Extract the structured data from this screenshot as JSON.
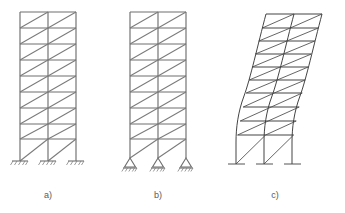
{
  "figure": {
    "background_color": "#ffffff",
    "line_color": "#6e6e6e",
    "deformed_line_color": "#3a3a3a",
    "caption_color": "#5a5a5a"
  },
  "panels": [
    {
      "id": "a",
      "label": "a)",
      "description": "Braced frame with fixed bases",
      "support_type": "fixed",
      "bays": 2,
      "stories": 9,
      "brace_direction": "bottom-left-to-top-right",
      "columns_x": [
        20,
        48,
        76
      ],
      "base_y": 161,
      "top_y": 12,
      "ground_story_height": 22,
      "typical_story_height": 16,
      "caption_x": 48,
      "caption_y": 198
    },
    {
      "id": "b",
      "label": "b)",
      "description": "Braced frame with pinned bases",
      "support_type": "pinned",
      "bays": 2,
      "stories": 9,
      "brace_direction": "bottom-left-to-top-right",
      "columns_x": [
        130,
        158,
        186
      ],
      "base_y": 158,
      "top_y": 12,
      "ground_story_height": 22,
      "typical_story_height": 16,
      "caption_x": 158,
      "caption_y": 198
    },
    {
      "id": "c",
      "label": "c)",
      "description": "Deformed shape of braced frame under lateral load",
      "support_type": "ground-line",
      "bays": 2,
      "stories": 9,
      "brace_direction": "bottom-left-to-top-right",
      "columns_x": [
        240,
        268,
        296
      ],
      "base_y": 164,
      "top_y": 12,
      "top_drift_x": 44,
      "ground_story_height": 24,
      "typical_story_height": 16,
      "caption_x": 275,
      "caption_y": 198
    }
  ],
  "captions": {
    "a": "a)",
    "b": "b)",
    "c": "c)"
  }
}
